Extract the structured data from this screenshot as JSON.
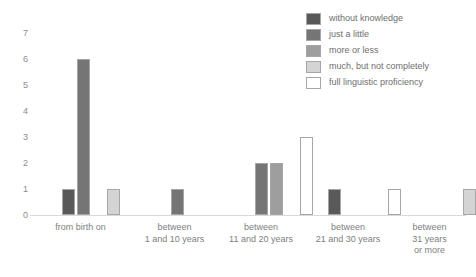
{
  "chart_data": {
    "type": "bar",
    "title": "",
    "subtitle": "",
    "xlabel": "",
    "ylabel": "",
    "ylim": [
      0,
      7
    ],
    "yticks": [
      0,
      1,
      2,
      3,
      4,
      5,
      6,
      7
    ],
    "ytick_labels": [
      "0",
      "1",
      "2",
      "3",
      "4",
      "5",
      "6",
      "7"
    ],
    "grid": false,
    "legend_position": "top-right",
    "categories": [
      "from birth on",
      "between\n1 and 10 years",
      "between\n11 and 20 years",
      "between\n21 and 30 years",
      "between\n31 years\nor more"
    ],
    "series": [
      {
        "name": "without knowledge",
        "color": "#595959",
        "values": [
          1,
          0,
          0,
          1,
          0
        ]
      },
      {
        "name": "just a little",
        "color": "#757575",
        "values": [
          6,
          1,
          2,
          0,
          0
        ]
      },
      {
        "name": "more or less",
        "color": "#9e9e9e",
        "values": [
          0,
          0,
          2,
          0,
          0
        ]
      },
      {
        "name": "much, but not completely",
        "color": "#d4d4d4",
        "values": [
          1,
          0,
          0,
          0,
          1
        ]
      },
      {
        "name": "full linguistic proficiency",
        "color": "#ffffff",
        "values": [
          0,
          0,
          3,
          1,
          0
        ]
      }
    ]
  },
  "legend": {
    "items": [
      {
        "label": "without knowledge",
        "color": "#595959"
      },
      {
        "label": "just a little",
        "color": "#757575"
      },
      {
        "label": "more or less",
        "color": "#9e9e9e"
      },
      {
        "label": "much, but not completely",
        "color": "#d4d4d4"
      },
      {
        "label": "full linguistic proficiency",
        "color": "#ffffff"
      }
    ]
  },
  "axes": {
    "y_ticks": [
      "7",
      "6",
      "5",
      "4",
      "3",
      "2",
      "1",
      "0"
    ],
    "x_labels": [
      "from birth on",
      "between\n1 and 10 years",
      "between\n11 and 20 years",
      "between\n21 and 30 years",
      "between\n31 years\nor more"
    ]
  }
}
